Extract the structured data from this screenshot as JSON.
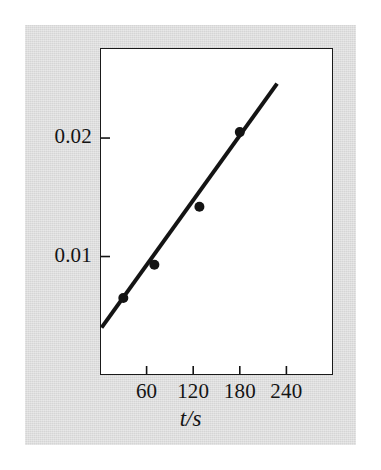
{
  "figure": {
    "background_color": "#ffffff",
    "panel_color": "#d5d5d5",
    "plot_area_color": "#ffffff",
    "ink_color": "#141414"
  },
  "chart_data": {
    "type": "scatter",
    "title": "",
    "subtitle": "",
    "xlabel": "t/s",
    "ylabel": "",
    "xlim": [
      0,
      300
    ],
    "ylim": [
      0,
      0.0276
    ],
    "grid": false,
    "legend": null,
    "x_ticks": [
      60,
      120,
      180,
      240
    ],
    "x_tick_labels": [
      "60",
      "120",
      "180",
      "240"
    ],
    "y_ticks": [
      0.01,
      0.02
    ],
    "y_tick_labels": [
      "0.01",
      "0.02"
    ],
    "points": [
      {
        "x": 30,
        "y": 0.0065
      },
      {
        "x": 70,
        "y": 0.0093
      },
      {
        "x": 128,
        "y": 0.0142
      },
      {
        "x": 180,
        "y": 0.0205
      }
    ],
    "series": [
      {
        "name": "data",
        "marker": "filled-circle",
        "x": [
          30,
          70,
          128,
          180
        ],
        "values": [
          0.0065,
          0.0093,
          0.0142,
          0.0205
        ]
      },
      {
        "name": "best-fit-line",
        "type": "line",
        "x": [
          2,
          228
        ],
        "values": [
          0.004,
          0.0246
        ]
      }
    ],
    "annotations": []
  }
}
